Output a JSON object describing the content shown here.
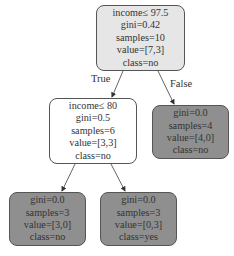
{
  "tree": {
    "root": {
      "lines": [
        "income≤ 97.5",
        "gini=0.42",
        "samples=10",
        "value=[7,3]",
        "class=no"
      ],
      "fill": "#e6e6e6"
    },
    "left": {
      "lines": [
        "income≤ 80",
        "gini=0.5",
        "samples=6",
        "value=[3,3]",
        "class=no"
      ],
      "fill": "#ffffff"
    },
    "right": {
      "lines": [
        "gini=0.0",
        "samples=4",
        "value=[4,0]",
        "class=no"
      ],
      "fill": "#8f8f8f"
    },
    "left_left": {
      "lines": [
        "gini=0.0",
        "samples=3",
        "value=[3,0]",
        "class=no"
      ],
      "fill": "#8f8f8f"
    },
    "left_right": {
      "lines": [
        "gini=0.0",
        "samples=3",
        "value=[0,3]",
        "class=yes"
      ],
      "fill": "#8f8f8f"
    },
    "edge_labels": {
      "true": "True",
      "false": "False"
    }
  }
}
